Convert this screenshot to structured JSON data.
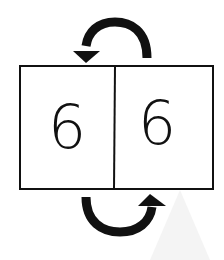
{
  "diagram": {
    "boxes": [
      {
        "label": "6"
      },
      {
        "label": "6"
      }
    ],
    "arrows": [
      {
        "position": "top",
        "direction": "right-to-left",
        "icon": "curved-arrow-left-icon"
      },
      {
        "position": "bottom",
        "direction": "left-to-right",
        "icon": "curved-arrow-right-icon"
      }
    ],
    "colors": {
      "stroke": "#111111",
      "background": "#ffffff"
    }
  }
}
